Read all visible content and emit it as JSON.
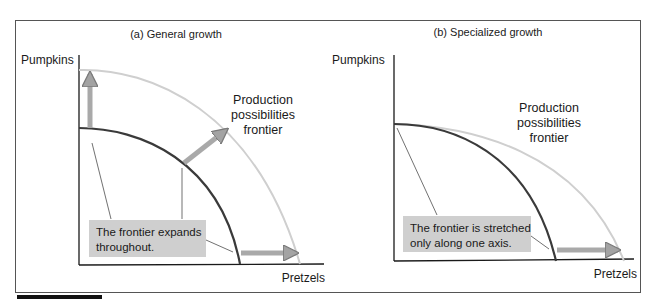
{
  "colors": {
    "frame": "#555555",
    "axis": "#1a1a1a",
    "ppf_old": "#3a3a3a",
    "ppf_new": "#cfcfcf",
    "arrow_fill": "#a9a9a9",
    "arrow_stroke": "#7a7a7a",
    "note_box": "#cfcfcf",
    "leader": "#333333"
  },
  "panels": [
    {
      "id": "a",
      "title": "(a) General growth",
      "y_axis_label": "Pumpkins",
      "x_axis_label": "Pretzels",
      "frontier_label": [
        "Production",
        "possibilities",
        "frontier"
      ],
      "note": [
        "The frontier expands",
        "throughout."
      ],
      "growth_type": "general"
    },
    {
      "id": "b",
      "title": "(b) Specialized growth",
      "y_axis_label": "Pumpkins",
      "x_axis_label": "Pretzels",
      "frontier_label": [
        "Production",
        "possibilities",
        "frontier"
      ],
      "note": [
        "The frontier is stretched",
        "only along one axis."
      ],
      "growth_type": "specialized"
    }
  ]
}
